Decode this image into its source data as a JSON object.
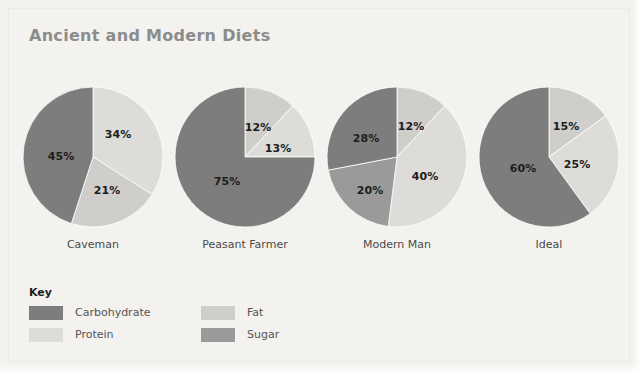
{
  "figure": {
    "title": "Ancient and Modern Diets",
    "background_color": "#f3f2ee",
    "title_color": "#8c8c8c"
  },
  "legend": {
    "title": "Key",
    "items": [
      {
        "label": "Carbohydrate",
        "color": "#7d7d7d"
      },
      {
        "label": "Protein",
        "color": "#dddcd8"
      },
      {
        "label": "Fat",
        "color": "#cfcecb"
      },
      {
        "label": "Sugar",
        "color": "#9a9a9a"
      }
    ]
  },
  "chart_data": {
    "type": "pie",
    "title": "Ancient and Modern Diets",
    "xlabel": "",
    "ylabel": "",
    "legend_position": "bottom-left",
    "grid": false,
    "value_unit": "%",
    "categories": [
      "Carbohydrate",
      "Protein",
      "Fat",
      "Sugar"
    ],
    "category_colors": {
      "Carbohydrate": "#7d7d7d",
      "Protein": "#dddcd8",
      "Fat": "#cfcecb",
      "Sugar": "#9a9a9a"
    },
    "charts": [
      {
        "name": "Caveman",
        "caption": "Caveman",
        "slices": [
          {
            "category": "Protein",
            "value": 34,
            "label": "34%",
            "label_x": 96,
            "label_y": 48
          },
          {
            "category": "Fat",
            "value": 21,
            "label": "21%",
            "label_x": 85,
            "label_y": 104
          },
          {
            "category": "Carbohydrate",
            "value": 45,
            "label": "45%",
            "label_x": 39,
            "label_y": 70
          }
        ]
      },
      {
        "name": "Peasant Farmer",
        "caption": "Peasant Farmer",
        "slices": [
          {
            "category": "Fat",
            "value": 12,
            "label": "12%",
            "label_x": 84,
            "label_y": 41
          },
          {
            "category": "Protein",
            "value": 13,
            "label": "13%",
            "label_x": 104,
            "label_y": 62
          },
          {
            "category": "Carbohydrate",
            "value": 75,
            "label": "75%",
            "label_x": 53,
            "label_y": 95
          }
        ]
      },
      {
        "name": "Modern Man",
        "caption": "Modern Man",
        "slices": [
          {
            "category": "Fat",
            "value": 12,
            "label": "12%",
            "label_x": 85,
            "label_y": 40
          },
          {
            "category": "Protein",
            "value": 40,
            "label": "40%",
            "label_x": 99,
            "label_y": 90
          },
          {
            "category": "Sugar",
            "value": 20,
            "label": "20%",
            "label_x": 44,
            "label_y": 104
          },
          {
            "category": "Carbohydrate",
            "value": 28,
            "label": "28%",
            "label_x": 40,
            "label_y": 52
          }
        ]
      },
      {
        "name": "Ideal",
        "caption": "Ideal",
        "slices": [
          {
            "category": "Fat",
            "value": 15,
            "label": "15%",
            "label_x": 88,
            "label_y": 40
          },
          {
            "category": "Protein",
            "value": 25,
            "label": "25%",
            "label_x": 99,
            "label_y": 78
          },
          {
            "category": "Carbohydrate",
            "value": 60,
            "label": "60%",
            "label_x": 45,
            "label_y": 82
          }
        ]
      }
    ],
    "chart_positions_left": [
      18,
      170,
      322,
      474
    ]
  }
}
